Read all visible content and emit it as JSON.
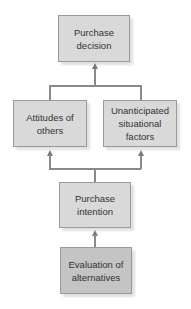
{
  "diagram": {
    "nodes": [
      {
        "id": "purchase-decision",
        "label": "Purchase decision"
      },
      {
        "id": "attitudes-of-others",
        "label": "Attitudes of others"
      },
      {
        "id": "unanticipated-situational-factors",
        "label": "Unanticipated situational factors"
      },
      {
        "id": "purchase-intention",
        "label": "Purchase intention"
      },
      {
        "id": "evaluation-of-alternatives",
        "label": "Evaluation of alternatives"
      }
    ],
    "edges": [
      {
        "from": "evaluation-of-alternatives",
        "to": "purchase-intention"
      },
      {
        "from": "purchase-intention",
        "to": "attitudes-of-others"
      },
      {
        "from": "purchase-intention",
        "to": "unanticipated-situational-factors"
      },
      {
        "from": "attitudes-of-others",
        "to": "purchase-decision"
      },
      {
        "from": "unanticipated-situational-factors",
        "to": "purchase-decision"
      }
    ],
    "colors": {
      "box_fill": "#d9d9d9",
      "box_fill_dark": "#c4c4c4",
      "line": "#8a8a8a"
    }
  }
}
